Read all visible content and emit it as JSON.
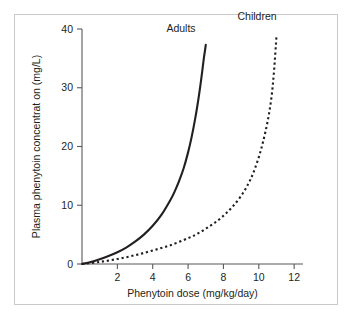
{
  "figure": {
    "border_color": "#c9c9c9",
    "background": "#ffffff"
  },
  "chart_data": {
    "type": "line",
    "title": "",
    "subtitle": "",
    "xlabel": "Phenytoin dose (mg/kg/day)",
    "ylabel": "Plasma phenytoin concentrat on (mg/L)",
    "xlim": [
      0,
      12.5
    ],
    "ylim": [
      0,
      40
    ],
    "xticks": [
      2,
      4,
      6,
      8,
      10,
      12
    ],
    "xtick_labels": [
      "2",
      "4",
      "6",
      "8",
      "10",
      "12"
    ],
    "yticks": [
      0,
      10,
      20,
      30,
      40
    ],
    "ytick_labels": [
      "0",
      "10",
      "20",
      "30",
      "40"
    ],
    "grid": false,
    "legend_position": "inline-annotation",
    "series": [
      {
        "name": "Adults",
        "style": "solid",
        "color": "#231f20",
        "label_position": {
          "x": 5.6,
          "y": 39.5
        },
        "x": [
          0,
          0.5,
          1.0,
          1.5,
          2.0,
          2.5,
          3.0,
          3.5,
          4.0,
          4.5,
          5.0,
          5.25,
          5.5,
          5.75,
          6.0,
          6.2,
          6.4,
          6.55,
          6.7,
          6.8,
          6.9,
          6.95,
          7.0
        ],
        "y": [
          0,
          0.35,
          0.8,
          1.35,
          2.0,
          2.8,
          3.8,
          5.0,
          6.5,
          8.4,
          10.9,
          12.4,
          14.2,
          16.3,
          19.0,
          21.6,
          24.7,
          27.4,
          30.5,
          32.8,
          35.2,
          36.2,
          37.3
        ]
      },
      {
        "name": "Children",
        "style": "dotted",
        "color": "#231f20",
        "label_position": {
          "x": 9.9,
          "y": 41.6
        },
        "x": [
          0,
          1.0,
          2.0,
          3.0,
          4.0,
          5.0,
          6.0,
          6.5,
          7.0,
          7.5,
          8.0,
          8.5,
          9.0,
          9.4,
          9.7,
          10.0,
          10.25,
          10.5,
          10.7,
          10.85,
          11.0
        ],
        "y": [
          0,
          0.35,
          0.85,
          1.5,
          2.3,
          3.2,
          4.4,
          5.1,
          6.0,
          7.0,
          8.2,
          9.7,
          11.6,
          13.6,
          15.6,
          18.2,
          20.9,
          24.3,
          28.0,
          32.4,
          38.8
        ]
      }
    ]
  },
  "annotations": {
    "adults_label": "Adults",
    "children_label": "Children"
  }
}
